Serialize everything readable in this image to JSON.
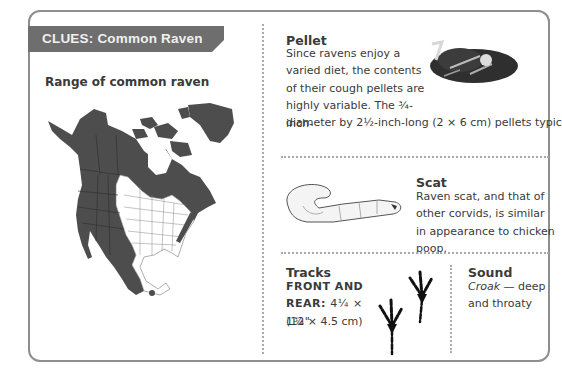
{
  "banner": {
    "label": "CLUES:",
    "title": "Common Raven",
    "color": "#6e6e6e"
  },
  "range": {
    "title": "Range of common raven"
  },
  "pellet": {
    "title": "Pellet",
    "text_wrapped": "Since ravens enjoy a varied diet, the contents of their cough pellets are highly variable. The ¾-inch-",
    "text_full": "diameter by 2½-inch-long (2 × 6 cm) pellets typically include small bones, fur, feathers, and bits of plastic."
  },
  "scat": {
    "title": "Scat",
    "text": "Raven scat, and that of other corvids, is similar in appearance to chicken poop."
  },
  "tracks": {
    "title": "Tracks",
    "label": "FRONT AND REAR:",
    "size_in": "4¼ × 1¾\"",
    "size_cm": "(12 × 4.5 cm)"
  },
  "sound": {
    "title": "Sound",
    "call": "Croak",
    "desc": " — deep and throaty"
  },
  "colors": {
    "range_fill": "#4d4d4d",
    "border": "#8e8e8e",
    "text": "#3a3a3a"
  }
}
